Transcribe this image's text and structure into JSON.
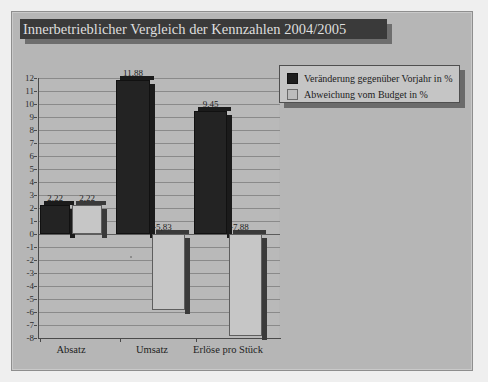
{
  "chart_data": {
    "type": "bar",
    "title": "Innerbetrieblicher Vergleich der Kennzahlen 2004/2005",
    "xlabel": "",
    "ylabel": "",
    "ylim": [
      -8,
      12
    ],
    "ytick_step": 1,
    "grid": true,
    "legend_position": "top-right",
    "categories": [
      "Absatz",
      "Umsatz",
      "Erlöse pro Stück"
    ],
    "series": [
      {
        "name": "Veränderung gegenüber Vorjahr in %",
        "color": "#232323",
        "values": [
          2.22,
          11.88,
          9.45
        ],
        "labels": [
          "2,22",
          "11,88",
          "9,45"
        ]
      },
      {
        "name": "Abweichung vom Budget in %",
        "color": "#c6c6c6",
        "values": [
          2.22,
          -5.83,
          -7.88
        ],
        "labels": [
          "2,22",
          "-5,83",
          "-7,88"
        ]
      }
    ],
    "yticks": [
      "12",
      "11",
      "10",
      "9",
      "8",
      "7",
      "6",
      "5",
      "4",
      "3",
      "2",
      "1",
      "0",
      "-1",
      "-2",
      "-3",
      "-4",
      "-5",
      "-6",
      "-7",
      "-8"
    ]
  },
  "chart": {
    "title": "Innerbetrieblicher Vergleich der Kennzahlen 2004/2005",
    "legend": {
      "items": [
        {
          "label": "Veränderung gegenüber Vorjahr in %",
          "swatch": "dark"
        },
        {
          "label": "Abweichung vom Budget in %",
          "swatch": "light"
        }
      ]
    },
    "axis": {
      "y_ticks": [
        "12",
        "11",
        "10",
        "9",
        "8",
        "7",
        "6",
        "5",
        "4",
        "3",
        "2",
        "1",
        "0",
        "-1",
        "-2",
        "-3",
        "-4",
        "-5",
        "-6",
        "-7",
        "-8"
      ],
      "x_categories": [
        "Absatz",
        "Umsatz",
        "Erlöse pro Stück"
      ]
    },
    "bars": [
      {
        "name": "absatz-veraenderung",
        "label": "2,22",
        "value": 2.22,
        "series": "dark"
      },
      {
        "name": "absatz-abweichung",
        "label": "2,22",
        "value": 2.22,
        "series": "light"
      },
      {
        "name": "umsatz-veraenderung",
        "label": "11,88",
        "value": 11.88,
        "series": "dark"
      },
      {
        "name": "umsatz-abweichung",
        "label": "-5,83",
        "value": -5.83,
        "series": "light"
      },
      {
        "name": "erloese-veraenderung",
        "label": "9,45",
        "value": 9.45,
        "series": "dark"
      },
      {
        "name": "erloese-abweichung",
        "label": "-7,88",
        "value": -7.88,
        "series": "light"
      }
    ],
    "colors": {
      "series_dark": "#232323",
      "series_light": "#c6c6c6",
      "panel_background": "#b6b6b6",
      "plot_background": "#b9b9b9",
      "title_band": "#3a3a3a",
      "title_text": "#dedede",
      "gridline": "#8a8a8a"
    }
  }
}
